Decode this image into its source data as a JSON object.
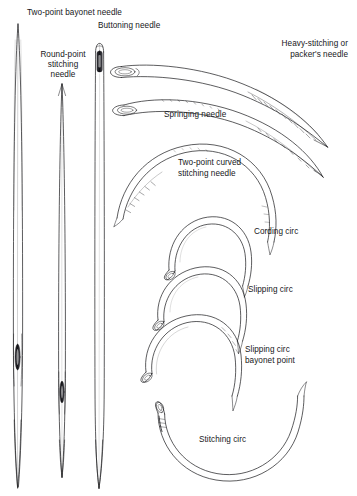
{
  "figure": {
    "kind": "technical-line-art-plate",
    "background_color": "#ffffff",
    "ink_color": "#17171a",
    "width": 357,
    "height": 496
  },
  "labels": {
    "two_point_bayonet": "Two-point bayonet needle",
    "buttoning": "Buttoning needle",
    "round_point_line1": "Round-point",
    "round_point_line2": "stitching",
    "round_point_line3": "needle",
    "heavy_line1": "Heavy-stitching or",
    "heavy_line2": "packer's needle",
    "springing": "Springing needle",
    "two_point_curved_line1": "Two-point curved",
    "two_point_curved_line2": "stitching needle",
    "cording_circ": "Cording circ",
    "slipping_circ": "Slipping circ",
    "slipping_bayonet_line1": "Slipping circ",
    "slipping_bayonet_line2": "bayonet point",
    "stitching_circ": "Stitching circ"
  },
  "straight_needles": [
    {
      "name": "two-point-bayonet-needle",
      "x": 18,
      "top": 22,
      "bottom": 488,
      "eye_y": 357
    },
    {
      "name": "round-point-stitching-needle",
      "x": 62,
      "top": 82,
      "bottom": 478,
      "eye_y": 392
    },
    {
      "name": "buttoning-needle",
      "x": 99,
      "top": 43,
      "bottom": 488,
      "eye_y": 62
    }
  ],
  "curved_needles": [
    {
      "name": "heavy-stitching-packers-needle",
      "shape": "long-shallow-curve"
    },
    {
      "name": "springing-needle",
      "shape": "long-shallow-curve"
    },
    {
      "name": "two-point-curved-stitching-needle",
      "shape": "wide-arc"
    },
    {
      "name": "cording-circ",
      "shape": "semicircle"
    },
    {
      "name": "slipping-circ",
      "shape": "semicircle"
    },
    {
      "name": "slipping-circ-bayonet-point",
      "shape": "semicircle"
    },
    {
      "name": "stitching-circ",
      "shape": "large-u-arc"
    }
  ]
}
